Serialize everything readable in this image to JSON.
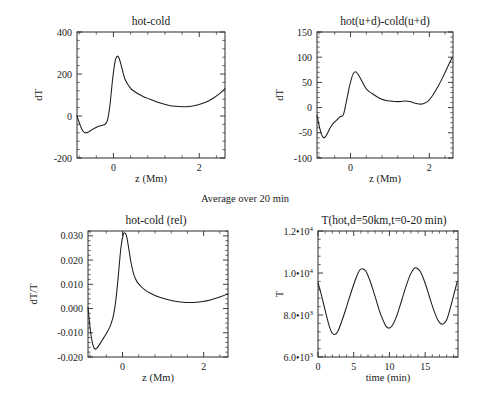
{
  "figure": {
    "center_note": "Average over 20 min",
    "width": 477,
    "height": 411,
    "background": "#ffffff",
    "line_color": "#1c1c1c"
  },
  "chart_data": [
    {
      "id": "panel-top-left",
      "type": "line",
      "title": "hot-cold",
      "xlabel": "z (Mm)",
      "ylabel": "dT",
      "xlim": [
        -0.85,
        2.6
      ],
      "ylim": [
        -200,
        400
      ],
      "xticks": [
        0,
        2
      ],
      "xticklabels": [
        "0",
        "2"
      ],
      "yticks": [
        -200,
        0,
        200,
        400
      ],
      "yticklabels": [
        "-200",
        "0",
        "200",
        "400"
      ],
      "grid": false,
      "legend": null,
      "x": [
        -0.85,
        -0.8,
        -0.74,
        -0.68,
        -0.62,
        -0.56,
        -0.5,
        -0.44,
        -0.38,
        -0.32,
        -0.26,
        -0.2,
        -0.14,
        -0.08,
        -0.02,
        0.04,
        0.09,
        0.14,
        0.2,
        0.26,
        0.33,
        0.4,
        0.48,
        0.58,
        0.7,
        0.85,
        1.0,
        1.15,
        1.3,
        1.45,
        1.6,
        1.75,
        1.9,
        2.05,
        2.2,
        2.35,
        2.48,
        2.6
      ],
      "y": [
        0,
        -30,
        -62,
        -78,
        -80,
        -73,
        -65,
        -58,
        -52,
        -48,
        -44,
        -40,
        -20,
        55,
        175,
        262,
        285,
        270,
        225,
        180,
        152,
        132,
        118,
        105,
        92,
        80,
        68,
        58,
        50,
        46,
        44,
        45,
        50,
        58,
        70,
        88,
        108,
        130
      ]
    },
    {
      "id": "panel-top-right",
      "type": "line",
      "title": "hot(u+d)-cold(u+d)",
      "xlabel": "z (Mm)",
      "ylabel": "dT",
      "xlim": [
        -0.85,
        2.6
      ],
      "ylim": [
        -100,
        150
      ],
      "xticks": [
        0,
        2
      ],
      "xticklabels": [
        "0",
        "2"
      ],
      "yticks": [
        -100,
        -50,
        0,
        50,
        100,
        150
      ],
      "yticklabels": [
        "-100",
        "-50",
        "0",
        "50",
        "100",
        "150"
      ],
      "grid": false,
      "legend": null,
      "x": [
        -0.85,
        -0.8,
        -0.74,
        -0.68,
        -0.62,
        -0.56,
        -0.5,
        -0.42,
        -0.34,
        -0.26,
        -0.18,
        -0.1,
        -0.02,
        0.06,
        0.13,
        0.2,
        0.28,
        0.36,
        0.45,
        0.55,
        0.66,
        0.78,
        0.9,
        1.02,
        1.14,
        1.26,
        1.38,
        1.5,
        1.62,
        1.74,
        1.86,
        1.98,
        2.1,
        2.22,
        2.34,
        2.46,
        2.58
      ],
      "y": [
        -15,
        -34,
        -52,
        -60,
        -56,
        -47,
        -38,
        -30,
        -24,
        -18,
        -14,
        14,
        44,
        66,
        71,
        65,
        54,
        42,
        33,
        28,
        22,
        17,
        14,
        13,
        12,
        12,
        13,
        12,
        9,
        7,
        8,
        14,
        26,
        42,
        60,
        80,
        100
      ]
    },
    {
      "id": "panel-bottom-left",
      "type": "line",
      "title": "hot-cold (rel)",
      "xlabel": "z (Mm)",
      "ylabel": "dT/T",
      "xlim": [
        -0.85,
        2.6
      ],
      "ylim": [
        -0.02,
        0.032
      ],
      "xticks": [
        0,
        2
      ],
      "xticklabels": [
        "0",
        "2"
      ],
      "yticks": [
        -0.02,
        -0.01,
        0.0,
        0.01,
        0.02,
        0.03
      ],
      "yticklabels": [
        "-0.020",
        "-0.010",
        "0.000",
        "0.010",
        "0.020",
        "0.030"
      ],
      "grid": false,
      "legend": null,
      "x": [
        -0.85,
        -0.82,
        -0.78,
        -0.73,
        -0.68,
        -0.63,
        -0.58,
        -0.52,
        -0.46,
        -0.4,
        -0.34,
        -0.28,
        -0.22,
        -0.16,
        -0.1,
        -0.04,
        0.02,
        0.06,
        0.1,
        0.15,
        0.21,
        0.28,
        0.36,
        0.45,
        0.56,
        0.7,
        0.86,
        1.02,
        1.18,
        1.34,
        1.5,
        1.66,
        1.82,
        1.98,
        2.14,
        2.3,
        2.45,
        2.6
      ],
      "y": [
        0.0005,
        -0.0045,
        -0.0105,
        -0.015,
        -0.0167,
        -0.0163,
        -0.0152,
        -0.0136,
        -0.012,
        -0.0104,
        -0.0086,
        -0.0062,
        -0.0026,
        0.004,
        0.014,
        0.025,
        0.0305,
        0.0312,
        0.03,
        0.0252,
        0.019,
        0.014,
        0.011,
        0.0092,
        0.0076,
        0.0062,
        0.005,
        0.0041,
        0.0034,
        0.0029,
        0.0026,
        0.0025,
        0.0026,
        0.0029,
        0.0034,
        0.0042,
        0.0051,
        0.006
      ]
    },
    {
      "id": "panel-bottom-right",
      "type": "line",
      "title": "T(hot,d=50km,t=0-20 min)",
      "xlabel": "time (min)",
      "ylabel": "T",
      "xlim": [
        0,
        19.6
      ],
      "ylim": [
        6000,
        12000
      ],
      "xticks": [
        0,
        5,
        10,
        15
      ],
      "xticklabels": [
        "0",
        "5",
        "10",
        "15"
      ],
      "yticks": [
        6000,
        8000,
        10000,
        12000
      ],
      "yticklabels": [
        "6.0•10³",
        "8.0•10³",
        "1.0•10⁴",
        "1.2•10⁴"
      ],
      "grid": false,
      "legend": null,
      "x": [
        0.0,
        0.4,
        0.8,
        1.2,
        1.6,
        2.0,
        2.4,
        2.8,
        3.3,
        3.8,
        4.3,
        4.8,
        5.3,
        5.8,
        6.2,
        6.7,
        7.2,
        7.7,
        8.2,
        8.7,
        9.2,
        9.6,
        10.0,
        10.4,
        10.9,
        11.4,
        11.9,
        12.4,
        12.9,
        13.4,
        13.8,
        14.3,
        14.8,
        15.3,
        15.8,
        16.3,
        16.8,
        17.2,
        17.6,
        18.0,
        18.5,
        19.0,
        19.5
      ],
      "y": [
        9530,
        9050,
        8500,
        7950,
        7450,
        7130,
        7080,
        7240,
        7680,
        8180,
        8720,
        9250,
        9740,
        10120,
        10200,
        10080,
        9700,
        9200,
        8650,
        8100,
        7680,
        7430,
        7380,
        7500,
        7850,
        8350,
        8900,
        9450,
        9900,
        10200,
        10240,
        10080,
        9700,
        9200,
        8650,
        8150,
        7750,
        7580,
        7590,
        7760,
        8300,
        8950,
        9600
      ]
    }
  ]
}
